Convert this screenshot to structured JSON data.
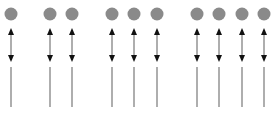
{
  "diagram": {
    "width": 279,
    "height": 113,
    "background": "#ffffff",
    "colors": {
      "circle_fill": "#8a8a8a",
      "arrow_head": "#111111",
      "arrow_shaft": "#9a9a9a",
      "line": "#8c8c8c"
    },
    "layout": {
      "circle_cy": 14,
      "circle_r": 6.5,
      "arrow_top_y": 28,
      "arrow_bottom_y": 62,
      "line_top_y": 67,
      "line_bottom_y": 107
    },
    "groups": [
      {
        "name": "group-1",
        "count": 1,
        "columns_x": [
          11
        ]
      },
      {
        "name": "group-2",
        "count": 2,
        "columns_x": [
          50,
          72
        ]
      },
      {
        "name": "group-3",
        "count": 3,
        "columns_x": [
          112,
          134,
          157
        ]
      },
      {
        "name": "group-4",
        "count": 4,
        "columns_x": [
          197,
          219,
          242,
          264
        ]
      }
    ],
    "element_types": {
      "circle": "circle-icon",
      "arrow": "double-arrow-icon",
      "line": "vertical-line"
    }
  }
}
